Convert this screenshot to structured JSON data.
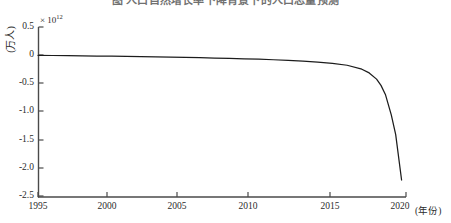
{
  "title": {
    "text": "图 人口自然增长率下降背景下的人口总量预测",
    "visible": "partially-cropped"
  },
  "axes": {
    "y_label": "(万人)",
    "y_exponent": "× 10",
    "y_exponent_power": "12",
    "x_label": "(年份)",
    "y_ticks": [
      "0.5",
      "0",
      "-0.5",
      "-1.0",
      "-1.5",
      "-2.0",
      "-2.5"
    ],
    "x_ticks": [
      "1995",
      "2000",
      "2005",
      "2010",
      "2015",
      "2020"
    ]
  },
  "colors": {
    "line": "#1c1c1c",
    "axis": "#4a4a4a",
    "background": "#ffffff",
    "text": "#2b2b2b"
  },
  "chart_data": {
    "type": "line",
    "title": "图 人口自然增长率下降背景下的人口总量预测",
    "xlabel": "(年份)",
    "ylabel": "(万人)",
    "y_scale_factor": "1e12",
    "xlim": [
      1995,
      2020
    ],
    "ylim": [
      -2.5,
      0.5
    ],
    "grid": false,
    "legend": null,
    "x_tick_values": [
      1995,
      2000,
      2005,
      2010,
      2015,
      2020
    ],
    "y_tick_values": [
      0.5,
      0,
      -0.5,
      -1.0,
      -1.5,
      -2.0,
      -2.5
    ],
    "series": [
      {
        "name": "人口总量",
        "x": [
          1995,
          1996,
          1997,
          1998,
          1999,
          2000,
          2001,
          2002,
          2003,
          2004,
          2005,
          2006,
          2007,
          2008,
          2009,
          2010,
          2011,
          2012,
          2013,
          2014,
          2015,
          2016,
          2017,
          2017.5,
          2018,
          2018.3,
          2018.6,
          2019,
          2019.3,
          2019.7
        ],
        "values": [
          0.0,
          -0.003,
          -0.006,
          -0.009,
          -0.013,
          -0.016,
          -0.02,
          -0.024,
          -0.028,
          -0.032,
          -0.037,
          -0.042,
          -0.048,
          -0.054,
          -0.061,
          -0.069,
          -0.078,
          -0.089,
          -0.102,
          -0.118,
          -0.14,
          -0.175,
          -0.245,
          -0.31,
          -0.42,
          -0.53,
          -0.69,
          -1.05,
          -1.4,
          -2.2
        ]
      }
    ]
  }
}
